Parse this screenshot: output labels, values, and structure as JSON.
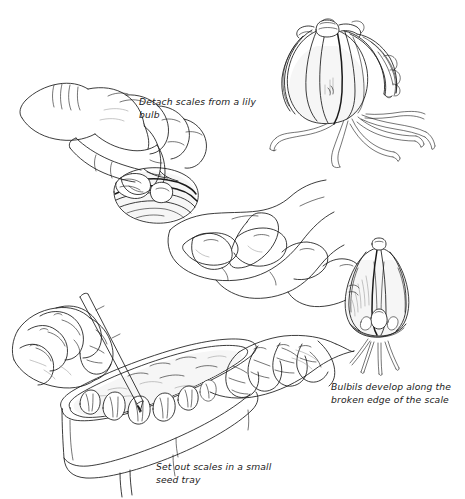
{
  "figure": {
    "medium": "pen-and-ink line drawing",
    "background_color": "#ffffff",
    "ink_color": "#1a1a1a",
    "shading_color": "#b8b8b8"
  },
  "captions": {
    "detach": "Detach scales from a lily\nbulb",
    "bulbils": "Bulbils develop along the\nbroken edge of the scale",
    "tray": "Set out scales in a small\nseed tray"
  },
  "panels": [
    {
      "name": "hands-detaching-scale",
      "description": "Two hands, upper hand pinching a scale away from a lily bulb held in the lower cupped hand"
    },
    {
      "name": "whole-lily-bulb",
      "description": "Whole lily bulb with overlapping vertical scales and trailing roots"
    },
    {
      "name": "hands-setting-scales-in-tray",
      "description": "Two hands inserting lily scales upright into compost in a small seed tray, using a pencil dibber"
    },
    {
      "name": "scale-with-bulbils",
      "description": "Detached lily scale with small bulbils forming along its broken basal edge and roots below"
    }
  ]
}
